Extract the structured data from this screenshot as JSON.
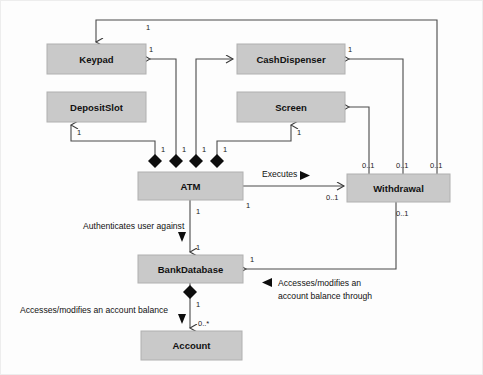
{
  "diagram": {
    "type": "uml-class-diagram",
    "background_color": "#fdfdfd",
    "class_box_fill": "#c9c9c9",
    "line_color": "#4a4a4a",
    "classes": [
      {
        "id": "keypad",
        "name": "Keypad",
        "x": 47,
        "y": 44,
        "w": 99,
        "h": 30
      },
      {
        "id": "cashdispenser",
        "name": "CashDispenser",
        "x": 237,
        "y": 44,
        "w": 108,
        "h": 30
      },
      {
        "id": "depositslot",
        "name": "DepositSlot",
        "x": 47,
        "y": 92,
        "w": 99,
        "h": 30
      },
      {
        "id": "screen",
        "name": "Screen",
        "x": 237,
        "y": 92,
        "w": 108,
        "h": 30
      },
      {
        "id": "atm",
        "name": "ATM",
        "x": 138,
        "y": 172,
        "w": 105,
        "h": 28
      },
      {
        "id": "withdrawal",
        "name": "Withdrawal",
        "x": 347,
        "y": 174,
        "w": 103,
        "h": 28
      },
      {
        "id": "bankdatabase",
        "name": "BankDatabase",
        "x": 138,
        "y": 255,
        "w": 105,
        "h": 28
      },
      {
        "id": "account",
        "name": "Account",
        "x": 141,
        "y": 331,
        "w": 101,
        "h": 29
      }
    ],
    "association_labels": [
      {
        "id": "executes",
        "text": "Executes",
        "x": 262,
        "y": 177
      },
      {
        "id": "authenticates",
        "text": "Authenticates user against",
        "x": 83,
        "y": 229
      },
      {
        "id": "accesses-top",
        "text": "Accesses/modifies an",
        "x": 278,
        "y": 281
      },
      {
        "id": "accesses-bottom",
        "text": "account balance through",
        "x": 278,
        "y": 294
      },
      {
        "id": "accesses-balance",
        "text": "Accesses/modifies an account balance",
        "x": 20,
        "y": 313
      }
    ],
    "multiplicities": [
      {
        "id": "m-keypad-top",
        "text": "1",
        "x": 146,
        "y": 30
      },
      {
        "id": "m-keypad-right",
        "text": "1",
        "x": 149,
        "y": 52
      },
      {
        "id": "m-cashdisp-right",
        "text": "1",
        "x": 348,
        "y": 52
      },
      {
        "id": "m-depositslot-bot",
        "text": "1",
        "x": 77,
        "y": 135
      },
      {
        "id": "m-screen-bot",
        "text": "1",
        "x": 297,
        "y": 135
      },
      {
        "id": "m-atm-d1",
        "text": "1",
        "x": 161,
        "y": 167
      },
      {
        "id": "m-atm-d2",
        "text": "1",
        "x": 182,
        "y": 167
      },
      {
        "id": "m-atm-d3",
        "text": "1",
        "x": 202,
        "y": 167
      },
      {
        "id": "m-atm-d4",
        "text": "1",
        "x": 223,
        "y": 167
      },
      {
        "id": "m-atm-right",
        "text": "1",
        "x": 246,
        "y": 208
      },
      {
        "id": "m-withdraw-t1",
        "text": "0..1",
        "x": 362,
        "y": 168
      },
      {
        "id": "m-withdraw-t2",
        "text": "0..1",
        "x": 396,
        "y": 168
      },
      {
        "id": "m-withdraw-t3",
        "text": "0..1",
        "x": 430,
        "y": 168
      },
      {
        "id": "m-withdraw-left",
        "text": "0..1",
        "x": 326,
        "y": 200
      },
      {
        "id": "m-withdraw-bot",
        "text": "0..1",
        "x": 396,
        "y": 216
      },
      {
        "id": "m-atm-bankdb",
        "text": "1",
        "x": 196,
        "y": 214
      },
      {
        "id": "m-bankdb-top",
        "text": "1",
        "x": 196,
        "y": 250
      },
      {
        "id": "m-bankdb-right",
        "text": "1",
        "x": 250,
        "y": 262
      },
      {
        "id": "m-bankdb-account",
        "text": "1",
        "x": 196,
        "y": 303
      },
      {
        "id": "m-account-top",
        "text": "0..*",
        "x": 198,
        "y": 326
      }
    ]
  }
}
